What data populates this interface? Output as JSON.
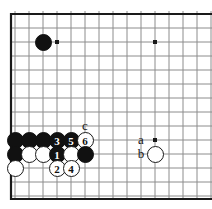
{
  "diagram": {
    "kind": "go-board-diagram",
    "board": {
      "background_color": "#ffffff",
      "line_color": "#8c8c8c",
      "edge_color": "#1a1a1a",
      "grid_spacing": 14,
      "origin_x": 15,
      "origin_y": 14,
      "columns": 14,
      "rows": 13,
      "edges": {
        "left": true,
        "top": true,
        "bottom": true,
        "right": false
      }
    },
    "star_points": [
      {
        "name": "star-point-upper-left",
        "col": 3,
        "row": 2
      },
      {
        "name": "star-point-upper-right",
        "col": 10,
        "row": 2
      },
      {
        "name": "star-point-lower-right",
        "col": 10,
        "row": 9
      }
    ],
    "stones": [
      {
        "id": "stone-black-corner-approach",
        "color": "black",
        "label": "",
        "col": 2,
        "row": 2
      },
      {
        "id": "stone-black-a1",
        "color": "black",
        "label": "",
        "col": 0,
        "row": 9
      },
      {
        "id": "stone-black-b1",
        "color": "black",
        "label": "",
        "col": 1,
        "row": 9
      },
      {
        "id": "stone-black-c1",
        "color": "black",
        "label": "",
        "col": 2,
        "row": 9
      },
      {
        "id": "stone-black-move-3",
        "color": "black",
        "label": "3",
        "col": 3,
        "row": 9
      },
      {
        "id": "stone-black-move-5",
        "color": "black",
        "label": "5",
        "col": 4,
        "row": 9
      },
      {
        "id": "stone-white-move-6",
        "color": "white",
        "label": "6",
        "col": 5,
        "row": 9
      },
      {
        "id": "stone-black-a2",
        "color": "black",
        "label": "",
        "col": 0,
        "row": 10
      },
      {
        "id": "stone-white-b2",
        "color": "white",
        "label": "",
        "col": 1,
        "row": 10
      },
      {
        "id": "stone-white-c2",
        "color": "white",
        "label": "",
        "col": 2,
        "row": 10
      },
      {
        "id": "stone-black-move-1",
        "color": "black",
        "label": "1",
        "col": 3,
        "row": 10
      },
      {
        "id": "stone-white-e2",
        "color": "white",
        "label": "",
        "col": 4,
        "row": 10
      },
      {
        "id": "stone-black-f2",
        "color": "black",
        "label": "",
        "col": 5,
        "row": 10
      },
      {
        "id": "stone-white-b-point",
        "color": "white",
        "label": "",
        "col": 10,
        "row": 10
      },
      {
        "id": "stone-white-a3",
        "color": "white",
        "label": "",
        "col": 0,
        "row": 11
      },
      {
        "id": "stone-white-move-2",
        "color": "white",
        "label": "2",
        "col": 3,
        "row": 11
      },
      {
        "id": "stone-white-move-4",
        "color": "white",
        "label": "4",
        "col": 4,
        "row": 11
      }
    ],
    "markers": [
      {
        "id": "marker-c",
        "label": "c",
        "col": 5,
        "row": 8
      },
      {
        "id": "marker-a",
        "label": "a",
        "col": 9,
        "row": 9
      },
      {
        "id": "marker-b",
        "label": "b",
        "col": 9,
        "row": 10
      }
    ],
    "move_sequence": [
      "1",
      "2",
      "3",
      "4",
      "5",
      "6"
    ],
    "point_labels": [
      "a",
      "b",
      "c"
    ]
  }
}
